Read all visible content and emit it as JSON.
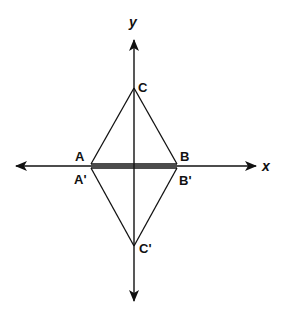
{
  "diagram": {
    "type": "reflection across x-axis",
    "axes": {
      "x_label": "x",
      "y_label": "y"
    },
    "original_triangle": {
      "vertices": {
        "A": "A",
        "B": "B",
        "C": "C"
      }
    },
    "image_triangle": {
      "vertices": {
        "A_prime": "A'",
        "B_prime": "B'",
        "C_prime": "C'"
      }
    },
    "colors": {
      "stroke": "#111111",
      "background": "#ffffff"
    }
  }
}
